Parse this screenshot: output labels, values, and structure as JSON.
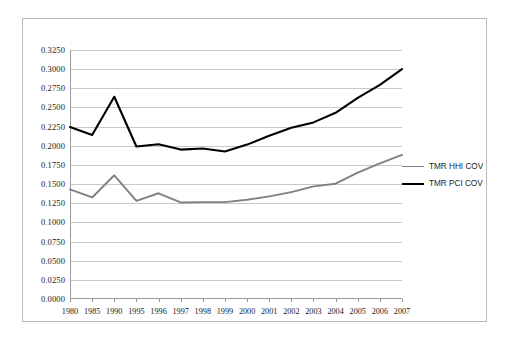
{
  "chart_data": {
    "type": "line",
    "title": "",
    "xlabel": "",
    "ylabel": "",
    "grid": true,
    "legend_position": "right",
    "categories": [
      "1980",
      "1985",
      "1990",
      "1995",
      "1996",
      "1997",
      "1998",
      "1999",
      "2000",
      "2001",
      "2002",
      "2003",
      "2004",
      "2005",
      "2006",
      "2007"
    ],
    "ylim": [
      0.0,
      0.325
    ],
    "ytick_labels": [
      "0.3250",
      "0.3000",
      "0.2750",
      "0.2500",
      "0.2250",
      "0.2000",
      "0.1750",
      "0.1500",
      "0.1250",
      "0.1000",
      "0.0750",
      "0.0500",
      "0.0250",
      "0.0000"
    ],
    "ytick_values": [
      0.325,
      0.3,
      0.275,
      0.25,
      0.225,
      0.2,
      0.175,
      0.15,
      0.125,
      0.1,
      0.075,
      0.05,
      0.025,
      0.0
    ],
    "series": [
      {
        "name": "TMR HHI COV",
        "color": "#808080",
        "values": [
          0.143,
          0.1325,
          0.1615,
          0.128,
          0.138,
          0.126,
          0.1265,
          0.1265,
          0.1295,
          0.134,
          0.1395,
          0.147,
          0.1505,
          0.165,
          0.177,
          0.188
        ]
      },
      {
        "name": "TMR PCI COV",
        "color": "#000000",
        "values": [
          0.2245,
          0.214,
          0.264,
          0.199,
          0.202,
          0.195,
          0.1965,
          0.1925,
          0.2015,
          0.213,
          0.2235,
          0.2305,
          0.243,
          0.2625,
          0.2795,
          0.3
        ]
      }
    ]
  },
  "legend": {
    "entries": [
      {
        "label": "TMR HHI COV",
        "color": "#808080"
      },
      {
        "label": "TMR PCI COV",
        "color": "#000000"
      }
    ]
  }
}
